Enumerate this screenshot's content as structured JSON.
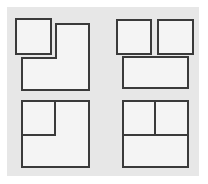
{
  "diagram": {
    "title": "",
    "background_color": "#e7e7e7",
    "shape_fill": "#f4f4f4",
    "stroke_color": "#3a3a3a",
    "panels": [
      {
        "id": "top-left",
        "description": "Small square overlapping top-left corner of an L-shaped region (separated)",
        "shapes": [
          {
            "type": "rect",
            "x": 16,
            "y": 19,
            "w": 35,
            "h": 35
          },
          {
            "type": "polygon",
            "points": "56,24 89,24 89,90 22,90 22,58 56,58"
          }
        ]
      },
      {
        "id": "top-right",
        "description": "Two squares above a wide rectangle (separated)",
        "shapes": [
          {
            "type": "rect",
            "x": 117,
            "y": 20,
            "w": 34,
            "h": 34
          },
          {
            "type": "rect",
            "x": 158,
            "y": 20,
            "w": 35,
            "h": 34
          },
          {
            "type": "rect",
            "x": 123,
            "y": 57,
            "w": 65,
            "h": 31
          }
        ]
      },
      {
        "id": "bottom-left",
        "description": "Square subdivided by small square in top-left corner (joined)",
        "shapes": [
          {
            "type": "rect",
            "x": 22,
            "y": 101,
            "w": 67,
            "h": 66
          },
          {
            "type": "polyline",
            "points": "22,135 55,135 55,101"
          }
        ]
      },
      {
        "id": "bottom-right",
        "description": "Square divided into two top cells and one bottom cell (joined)",
        "shapes": [
          {
            "type": "rect",
            "x": 123,
            "y": 101,
            "w": 65,
            "h": 66
          },
          {
            "type": "line",
            "x1": 123,
            "y1": 135,
            "x2": 188,
            "y2": 135
          },
          {
            "type": "line",
            "x1": 155,
            "y1": 101,
            "x2": 155,
            "y2": 135
          }
        ]
      }
    ]
  }
}
